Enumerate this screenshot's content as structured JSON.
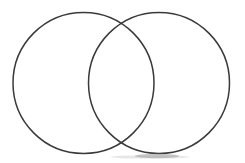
{
  "document": {
    "title": "Venn Diagram",
    "type": "two-set-venn-diagram",
    "background_color": "#ffffff",
    "width": 245,
    "height": 163
  },
  "diagram": {
    "name": "two-circle-venn-diagram",
    "stroke_color": "#3a3a3a",
    "stroke_width": 1.5,
    "fill": "none",
    "regions_labeled": false,
    "labels": [],
    "circles": [
      {
        "id": "left-circle",
        "name": "left-set-circle",
        "cx": 83.5,
        "cy": 83,
        "r": 70.5,
        "fill": "none",
        "stroke": "#3a3a3a"
      },
      {
        "id": "right-circle",
        "name": "right-set-circle",
        "cx": 159,
        "cy": 83,
        "r": 70.5,
        "fill": "none",
        "stroke": "#3a3a3a"
      }
    ],
    "intersection": {
      "name": "overlap-lens-region",
      "fill": "none",
      "top_point": {
        "x": 122,
        "y": 18
      },
      "bottom_point": {
        "x": 122,
        "y": 148
      }
    },
    "artifacts": [
      {
        "id": "bottom-smudge",
        "name": "scan-smudge-artifact",
        "cx": 157,
        "cy": 156,
        "rx": 22,
        "ry": 2.2,
        "color": "#9a9a9a"
      },
      {
        "id": "bottom-smudge-soft",
        "name": "scan-smudge-soft-artifact",
        "cx": 150,
        "cy": 157,
        "rx": 40,
        "ry": 1.6,
        "color": "#c8c8c8"
      }
    ]
  }
}
